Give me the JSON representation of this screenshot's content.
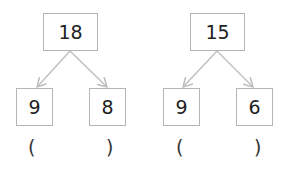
{
  "diagrams": [
    {
      "top": "18",
      "left": "9",
      "right": "8",
      "open_paren": "(",
      "close_paren": ")"
    },
    {
      "top": "15",
      "left": "9",
      "right": "6",
      "open_paren": "(",
      "close_paren": ")"
    }
  ],
  "colors": {
    "border": "#b5b5b5",
    "arrow": "#bdbdbd",
    "text": "#222222"
  }
}
